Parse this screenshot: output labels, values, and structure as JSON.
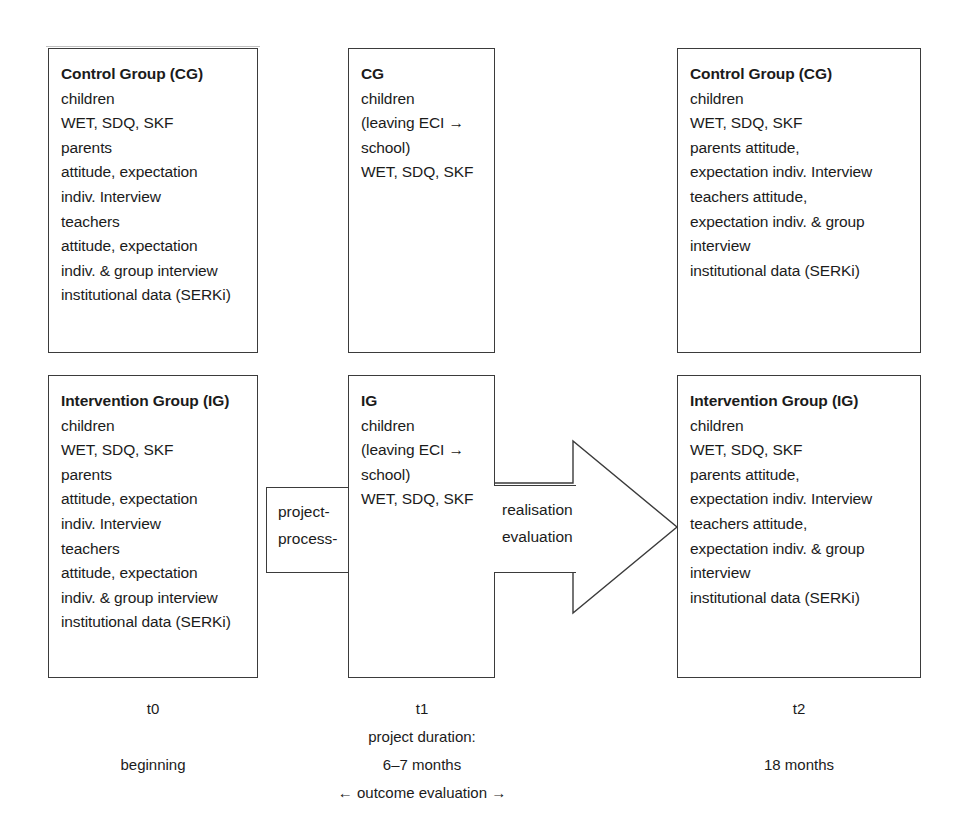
{
  "diagram": {
    "boxes": {
      "cg_t0": {
        "title": "Control Group (CG)",
        "lines": [
          "children",
          "WET, SDQ, SKF",
          "parents",
          "attitude, expectation",
          "indiv. Interview",
          "teachers",
          "attitude, expectation",
          "indiv. & group interview",
          "institutional data (SERKi)"
        ]
      },
      "cg_t1": {
        "title": "CG",
        "lines": [
          "children",
          "(leaving ECI →",
          "school)",
          "WET, SDQ, SKF"
        ]
      },
      "cg_t2": {
        "title": "Control Group (CG)",
        "lines": [
          "children",
          "WET, SDQ, SKF",
          "parents attitude,",
          "expectation indiv. Interview",
          "teachers attitude,",
          "expectation indiv. & group",
          "interview",
          "institutional data (SERKi)"
        ]
      },
      "ig_t0": {
        "title": "Intervention Group (IG)",
        "lines": [
          "children",
          "WET, SDQ, SKF",
          "parents",
          "attitude, expectation",
          "indiv. Interview",
          "teachers",
          "attitude, expectation",
          "indiv. & group interview",
          "institutional data (SERKi)"
        ]
      },
      "ig_t1": {
        "title": "IG",
        "lines": [
          "children",
          "(leaving ECI →",
          "school)",
          "WET, SDQ, SKF"
        ]
      },
      "ig_t2": {
        "title": "Intervention Group (IG)",
        "lines": [
          "children",
          "WET, SDQ, SKF",
          "parents attitude,",
          "expectation indiv. Interview",
          "teachers attitude,",
          "expectation indiv. & group",
          "interview",
          "institutional data (SERKi)"
        ]
      }
    },
    "connectors": {
      "project_process": {
        "line1": "project-",
        "line2": "process-"
      },
      "realisation": {
        "line1": "realisation",
        "line2": "evaluation"
      }
    },
    "timeline": {
      "t0": {
        "mark": "t0",
        "sub": "beginning"
      },
      "t1": {
        "mark": "t1",
        "duration_label": "project duration:",
        "sub": "6–7 months",
        "outcome": "← outcome evaluation →"
      },
      "t2": {
        "mark": "t2",
        "sub": "18 months"
      }
    },
    "style": {
      "stroke": "#3b3b3b",
      "text": "#1b1b1b",
      "background": "#ffffff"
    }
  }
}
